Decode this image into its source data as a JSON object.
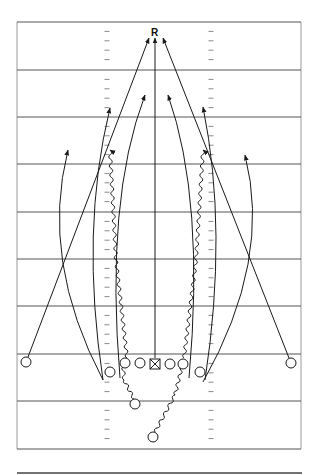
{
  "diagram": {
    "type": "football-play-diagram",
    "receiver_label": "R",
    "colors": {
      "line": "#1a1a1a",
      "yard_line": "#555555",
      "hash": "#8a8a8a",
      "border": "#9a9a9a",
      "background": "#ffffff"
    },
    "field": {
      "left": 17,
      "right": 301,
      "yard_lines_y": [
        22,
        70,
        117,
        164,
        212,
        259,
        306,
        354,
        401,
        449
      ],
      "hash_x": [
        107,
        211
      ],
      "bottom_rule_y": 473
    },
    "players": {
      "center": {
        "x": 155,
        "y": 364,
        "symbol": "square-x"
      },
      "linemen": [
        {
          "x": 125,
          "y": 363
        },
        {
          "x": 140,
          "y": 363
        },
        {
          "x": 170,
          "y": 364
        },
        {
          "x": 183,
          "y": 364
        }
      ],
      "ends": [
        {
          "x": 110,
          "y": 372
        },
        {
          "x": 200,
          "y": 372
        }
      ],
      "wide_receivers": [
        {
          "x": 26,
          "y": 362
        },
        {
          "x": 291,
          "y": 363
        }
      ],
      "backs": [
        {
          "x": 135,
          "y": 404
        },
        {
          "x": 153,
          "y": 437
        }
      ]
    }
  }
}
